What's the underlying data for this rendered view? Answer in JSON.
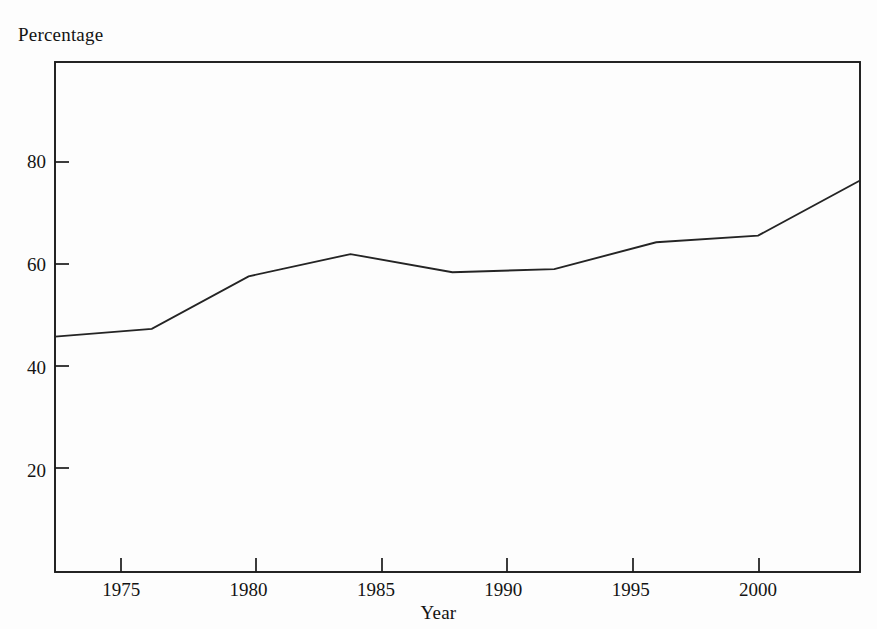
{
  "chart_data": {
    "type": "line",
    "title": "",
    "xlabel": "Year",
    "ylabel": "Percentage",
    "xlim": [
      1972.4,
      2004.0
    ],
    "ylim": [
      0.6,
      99.6
    ],
    "grid": false,
    "legend": null,
    "x_ticks": [
      1975,
      1980,
      1985,
      1990,
      1995,
      2000
    ],
    "x_tick_labels": [
      "1975",
      "1980",
      "1985",
      "1990",
      "1995",
      "2000"
    ],
    "y_ticks": [
      20,
      40,
      60,
      80
    ],
    "y_tick_labels": [
      "20",
      "40",
      "60",
      "80"
    ],
    "series": [
      {
        "name": "Percentage",
        "color": "#242424",
        "x": [
          1972.4,
          1976.2,
          1980.0,
          1984.0,
          1988.0,
          1992.0,
          1996.0,
          2000.0,
          2004.0
        ],
        "values": [
          46.3,
          47.8,
          58.0,
          62.3,
          58.8,
          59.4,
          64.6,
          65.9,
          76.6
        ]
      }
    ]
  },
  "labels": {
    "y_axis_title": "Percentage",
    "x_axis_title": "Year"
  },
  "colors": {
    "line": "#242424",
    "axis": "#1a1a1a",
    "background": "#fdfdfd",
    "text": "#141414"
  }
}
